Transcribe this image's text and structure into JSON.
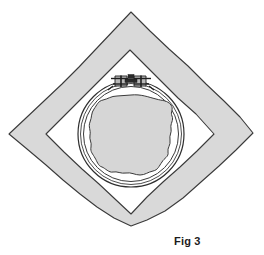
{
  "figure": {
    "caption": "Fig 3",
    "colors": {
      "background": "#ffffff",
      "fabric_band_fill": "#d9d9d9",
      "fabric_inner_fill": "#ffffff",
      "design_area_fill": "#d6d6d6",
      "outline": "#3a3a3a",
      "hoop_ring": "#2e2e2e",
      "hardware": "#1f1f1f",
      "caption_text": "#1c1c1c"
    },
    "parts": [
      {
        "id": "fabric-outer-diamond",
        "label": "Fabric square set on point",
        "shape": "diamond",
        "fill": "#d9d9d9",
        "corners": {
          "top": [
            131,
            12
          ],
          "right": [
            253,
            133
          ],
          "bottom": [
            131,
            226
          ],
          "left": [
            9,
            134
          ]
        }
      },
      {
        "id": "fabric-inner-diamond",
        "label": "Inner fabric opening",
        "shape": "diamond",
        "fill": "#ffffff",
        "corners": {
          "top": [
            130,
            50
          ],
          "right": [
            214,
            134
          ],
          "bottom": [
            131,
            214
          ],
          "left": [
            46,
            134
          ]
        }
      },
      {
        "id": "hoop-outer-ring",
        "label": "Outer hoop ring",
        "shape": "circle",
        "center": [
          131,
          134
        ],
        "radius": 53
      },
      {
        "id": "hoop-inner-ring",
        "label": "Inner hoop ring",
        "shape": "circle",
        "center": [
          131,
          134
        ],
        "radius": 48
      },
      {
        "id": "design-area",
        "label": "Stitched design area",
        "shape": "irregular-circle",
        "center": [
          131,
          135
        ],
        "radius": 40,
        "fill": "#d6d6d6"
      },
      {
        "id": "tension-screw",
        "label": "Hoop tension screw and bracket",
        "position": [
          131,
          80
        ]
      }
    ]
  }
}
